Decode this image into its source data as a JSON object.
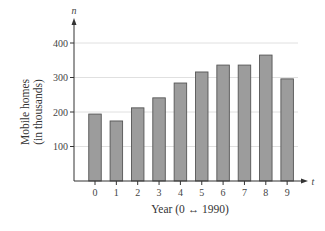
{
  "chart_data": {
    "type": "bar",
    "title": "",
    "xlabel": "Year (0 ↔ 1990)",
    "ylabel_lines": [
      "Mobile homes",
      "(in thousands)"
    ],
    "x_axis_var": "t",
    "y_axis_var": "n",
    "categories": [
      "0",
      "1",
      "2",
      "3",
      "4",
      "5",
      "6",
      "7",
      "8",
      "9"
    ],
    "values": [
      194,
      174,
      212,
      241,
      284,
      316,
      336,
      336,
      365,
      296
    ],
    "yticks": [
      100,
      200,
      300,
      400
    ],
    "ylim": [
      0,
      450
    ],
    "grid": true,
    "legend": null,
    "colors": {
      "bar_fill": "#9c9c9c",
      "bar_stroke": "#555555",
      "axis": "#333333",
      "grid": "#d8d8d8"
    }
  }
}
